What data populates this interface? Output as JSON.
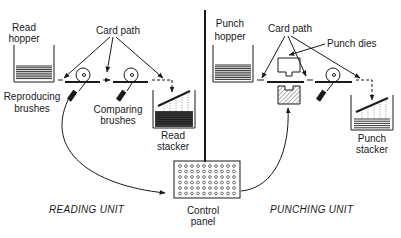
{
  "colors": {
    "ink": "#1a1a1a",
    "background": "#ffffff"
  },
  "labels": {
    "read_hopper": [
      "Read",
      "hopper"
    ],
    "card_path_left": "Card path",
    "reproducing_brushes": [
      "Reproducing",
      "brushes"
    ],
    "comparing_brushes": [
      "Comparing",
      "brushes"
    ],
    "read_stacker": [
      "Read",
      "stacker"
    ],
    "punch_hopper": [
      "Punch",
      "hopper"
    ],
    "card_path_right": "Card path",
    "punch_dies": "Punch dies",
    "punch_stacker": [
      "Punch",
      "stacker"
    ],
    "control_panel": [
      "Control",
      "panel"
    ],
    "reading_unit": "READING UNIT",
    "punching_unit": "PUNCHING UNIT"
  },
  "control_panel_grid": {
    "rows": 6,
    "cols": 10
  }
}
